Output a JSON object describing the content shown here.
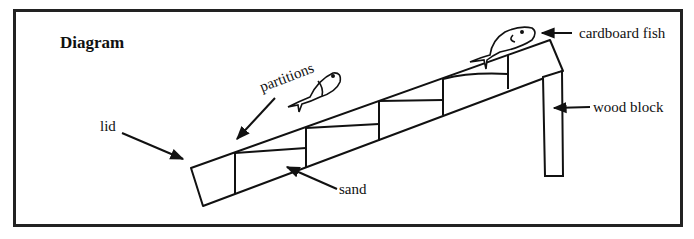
{
  "figure": {
    "title": "Diagram",
    "labels": {
      "lid": "lid",
      "partitions": "partitions",
      "sand": "sand",
      "cardboard_fish": "cardboard fish",
      "wood_block": "wood block"
    },
    "colors": {
      "ink": "#111111",
      "border": "#222222",
      "background": "#ffffff"
    }
  }
}
